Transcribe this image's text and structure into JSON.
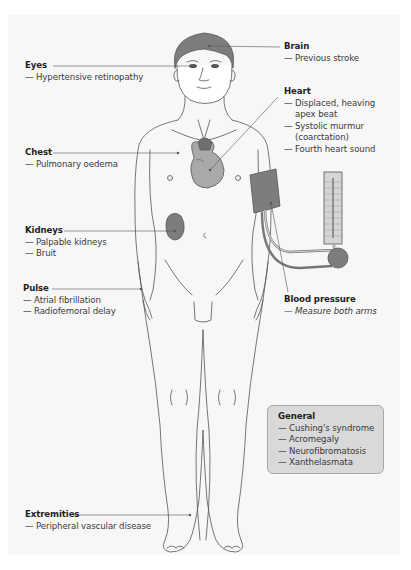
{
  "figure": {
    "background_color": "#f7f7f7",
    "line_color": "#555555",
    "fill_dark": "#7d7d7d",
    "fill_mid": "#a9a9a9",
    "fill_light": "#d5d5d5"
  },
  "labels": {
    "eyes": {
      "title": "Eyes",
      "items": [
        "Hypertensive retinopathy"
      ]
    },
    "brain": {
      "title": "Brain",
      "items": [
        "Previous stroke"
      ]
    },
    "heart": {
      "title": "Heart",
      "items": [
        "Displaced, heaving",
        "apex beat",
        "Systolic murmur",
        "(coarctation)",
        "Fourth heart sound"
      ]
    },
    "chest": {
      "title": "Chest",
      "items": [
        "Pulmonary oedema"
      ]
    },
    "kidneys": {
      "title": "Kidneys",
      "items": [
        "Palpable kidneys",
        "Bruit"
      ]
    },
    "pulse": {
      "title": "Pulse",
      "items": [
        "Atrial fibrillation",
        "Radiofemoral delay"
      ]
    },
    "blood_pressure": {
      "title": "Blood pressure",
      "items": [
        "Measure both arms"
      ]
    },
    "general": {
      "title": "General",
      "items": [
        "Cushing's syndrome",
        "Acromegaly",
        "Neurofibromatosis",
        "Xanthelasmata"
      ]
    },
    "extremities": {
      "title": "Extremities",
      "items": [
        "Peripheral vascular disease"
      ]
    }
  },
  "dash": "—"
}
